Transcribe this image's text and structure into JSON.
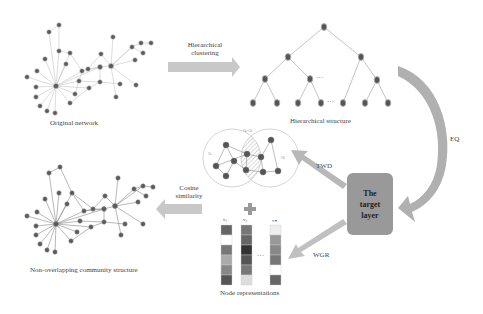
{
  "labels": {
    "original_network": "Original network",
    "hierarchical_clustering_line1": "Hierarchical",
    "hierarchical_clustering_line2": "clustering",
    "hierarchical_structure": "Hierarchical structure",
    "eq": "EQ",
    "target_layer_line1": "The",
    "target_layer_line2": "target",
    "target_layer_line3": "layer",
    "twd": "TWD",
    "wgr": "WGR",
    "cosine_line1": "Cosine",
    "cosine_line2": "similarity",
    "node_representations": "Node representations",
    "non_overlapping": "Non-overlapping community structure",
    "ellipsis": "···",
    "v1": "v₁",
    "v2": "v₂",
    "vn": "vₙ",
    "circle_left": "Ca",
    "circle_top": "Ca∩Cb",
    "circle_right": "Cb"
  },
  "colors": {
    "node": "#555555",
    "edge": "#bbbbbb",
    "arrow": "#aaaaaa",
    "target_box": "#999999"
  },
  "vectors": {
    "v1": [
      "#666",
      "#fff",
      "#777",
      "#aaa",
      "#888",
      "#555"
    ],
    "v2": [
      "#777",
      "#666",
      "#333",
      "#555",
      "#777",
      "#ddd"
    ],
    "vn": [
      "#eee",
      "#999",
      "#888",
      "#777",
      "#fff",
      "#666"
    ]
  }
}
